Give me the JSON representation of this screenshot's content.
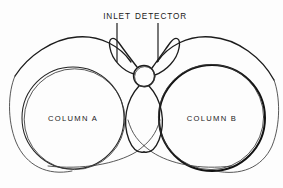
{
  "figure": {
    "background_color": "#fdfdfd",
    "ink_color": "#1a1a1a",
    "width": 283,
    "height": 188
  },
  "callouts": [
    {
      "id": "inlet",
      "label": "INLET",
      "text_x": 117,
      "text_y": 19,
      "leader_x": 117,
      "leader_y1": 23,
      "leader_y2": 62
    },
    {
      "id": "detector",
      "label": "DETECTOR",
      "text_x": 161,
      "text_y": 19,
      "leader_x": 158,
      "leader_y1": 23,
      "leader_y2": 62
    }
  ],
  "columns": [
    {
      "id": "column-a",
      "label": "COLUMN A",
      "cx": 73,
      "cy": 118,
      "r": 51,
      "label_x": 73,
      "label_y": 121,
      "weight": "thin"
    },
    {
      "id": "column-b",
      "label": "COLUMN B",
      "cx": 212,
      "cy": 118,
      "r": 53,
      "label_x": 212,
      "label_y": 121,
      "weight": "bold"
    }
  ],
  "detector_node": {
    "id": "detector-circle",
    "cx": 144,
    "cy": 76,
    "r": 10.5
  },
  "tubing": {
    "left_ear_loop": "M 138 66 C 128 54 121 46 117 40 C 112 34 110 40 114 50 C 118 60 128 70 136 73 Z",
    "right_ear_loop": "M 151 67 C 160 55 167 46 171 40 C 176 34 178 40 174 50 C 170 60 160 70 152 74 Z",
    "center_loop_left": "M 141 87 C 128 100 124 120 130 138 C 134 150 140 152 144 150",
    "center_loop_right": "M 147 87 C 160 100 164 120 158 138 C 154 150 148 152 144 150",
    "arc_left_upper": "M 131 61 C 120 46 100 36 78 38 C 54 40 30 56 17 74",
    "arc_right_upper": "M 157 61 C 168 46 188 36 210 38 C 236 40 260 58 272 78",
    "arc_left_cross": "M 130 142 C 110 152 78 162 44 166",
    "arc_right_cross": "M 158 142 C 180 152 214 162 248 166",
    "arc_left_tangent": "M 124 96 C 120 120 122 136 132 146",
    "arc_right_tangent": "M 164 96 C 168 120 166 136 156 146"
  }
}
